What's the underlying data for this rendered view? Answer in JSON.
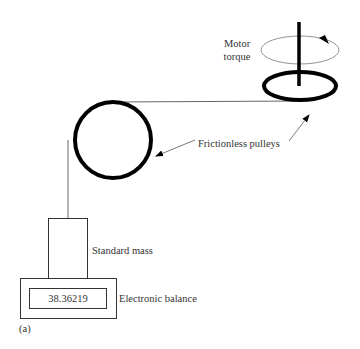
{
  "diagram": {
    "labels": {
      "motor_torque_line1": "Motor",
      "motor_torque_line2": "torque",
      "pulleys": "Frictionless pulleys",
      "standard_mass": "Standard mass",
      "balance": "Electronic balance",
      "balance_reading": "38.36219",
      "panel": "(a)"
    },
    "colors": {
      "stroke": "#000000",
      "thin_line": "#555555",
      "text": "#333333",
      "background": "#ffffff"
    }
  }
}
